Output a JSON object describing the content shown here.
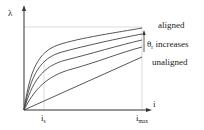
{
  "diagram": {
    "y_axis_label": "λ",
    "x_axis_label": "i",
    "x_ticks": [
      {
        "main": "i",
        "sub": "s"
      },
      {
        "main": "i",
        "sub": "max"
      }
    ],
    "annotations": {
      "top": "aligned",
      "arrow_label_symbol": "θ",
      "arrow_label_sub": "r",
      "arrow_label_text": " increases",
      "bottom": "unaligned"
    },
    "curve_count": 5,
    "colors": {
      "line": "#333333",
      "guide": "#bbbbbb"
    }
  }
}
